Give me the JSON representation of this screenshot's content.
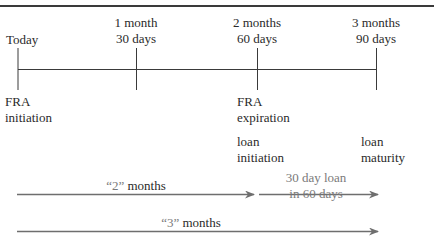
{
  "timeline": {
    "points": [
      {
        "line1": "Today",
        "line2": ""
      },
      {
        "line1": "1 month",
        "line2": "30 days"
      },
      {
        "line1": "2 months",
        "line2": "60 days"
      },
      {
        "line1": "3 months",
        "line2": "90 days"
      }
    ],
    "below_labels": {
      "fra_initiation": [
        "FRA",
        "initiation"
      ],
      "fra_expiration": [
        "FRA",
        "expiration"
      ],
      "loan_initiation": [
        "loan",
        "initiation"
      ],
      "loan_maturity": [
        "loan",
        "maturity"
      ]
    }
  },
  "arrows": {
    "two_months": {
      "quote": "“2”",
      "word": "months"
    },
    "loan_period": {
      "line1": "30 day loan",
      "line2": "in 60 days"
    },
    "three_months": {
      "quote": "“3”",
      "word": "months"
    }
  },
  "colors": {
    "line": "#3a3a3a",
    "arrow": "#6e6e6e",
    "text": "#2a2a2a",
    "muted_text": "#7a7a7a"
  }
}
